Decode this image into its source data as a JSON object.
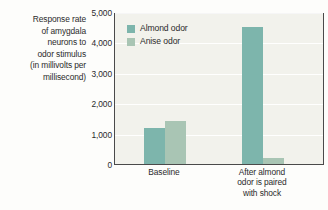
{
  "chart_data": {
    "type": "bar",
    "title": "",
    "subtitle": "",
    "xlabel": "",
    "ylabel": "Response rate of amygdala neurons to odor stimulus (in millivolts per millisecond)",
    "ylabel_lines": [
      "Response rate",
      "of amygdala",
      "neurons to",
      "odor stimulus",
      "(in millivolts per",
      "millisecond)"
    ],
    "categories": [
      "Baseline",
      "After almond odor is paired with shock"
    ],
    "category_label_lines": [
      [
        "Baseline"
      ],
      [
        "After almond",
        "odor is paired",
        "with shock"
      ]
    ],
    "series": [
      {
        "name": "Almond odor",
        "values": [
          1200,
          4500
        ],
        "color": "#7db5ac"
      },
      {
        "name": "Anise odor",
        "values": [
          1400,
          200
        ],
        "color": "#a9c5b4"
      }
    ],
    "ylim": [
      0,
      5000
    ],
    "yticks": [
      0,
      1000,
      2000,
      3000,
      4000,
      5000
    ],
    "ytick_labels": [
      "0",
      "1,000",
      "2,000",
      "3,000",
      "4,000",
      "5,000"
    ],
    "grid": true,
    "grid_axis": "y",
    "legend_position": "top-left",
    "plot_background": "#f2f2ec",
    "gridline_color": "#ffffff",
    "axis_color": "#4a4a4a",
    "text_color": "#2b2b2b"
  }
}
